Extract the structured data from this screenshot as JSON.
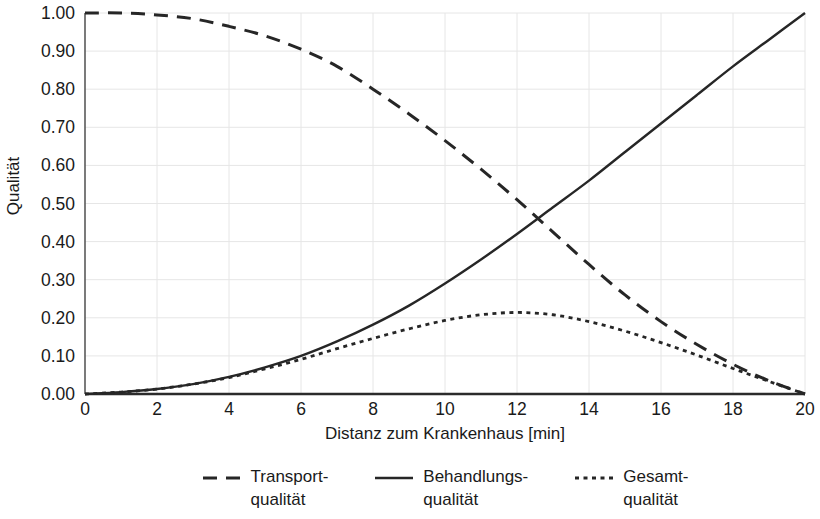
{
  "chart_data": {
    "type": "line",
    "title": "",
    "xlabel": "Distanz zum Krankenhaus [min]",
    "ylabel": "Qualität",
    "xlim": [
      0,
      20
    ],
    "ylim": [
      0,
      1.0
    ],
    "grid": true,
    "legend_position": "bottom",
    "x_ticks": [
      "0",
      "2",
      "4",
      "6",
      "8",
      "10",
      "12",
      "14",
      "16",
      "18",
      "20"
    ],
    "y_ticks": [
      "0.00",
      "0.10",
      "0.20",
      "0.30",
      "0.40",
      "0.50",
      "0.60",
      "0.70",
      "0.80",
      "0.90",
      "1.00"
    ],
    "x": [
      0,
      1,
      2,
      3,
      4,
      5,
      6,
      7,
      8,
      9,
      10,
      11,
      12,
      13,
      14,
      15,
      16,
      17,
      18,
      19,
      20
    ],
    "series": [
      {
        "name": "Transport-\nqualität",
        "legend_label": "Transport-\nqualität",
        "style": "dashed",
        "color": "#262626",
        "values": [
          1.0,
          1.0,
          0.995,
          0.985,
          0.965,
          0.94,
          0.905,
          0.86,
          0.8,
          0.735,
          0.665,
          0.59,
          0.51,
          0.425,
          0.34,
          0.26,
          0.19,
          0.13,
          0.078,
          0.035,
          0.0
        ]
      },
      {
        "name": "Behandlungs-\nqualität",
        "legend_label": "Behandlungs-\nqualität",
        "style": "solid",
        "color": "#262626",
        "values": [
          0.0,
          0.005,
          0.013,
          0.026,
          0.045,
          0.07,
          0.1,
          0.138,
          0.182,
          0.232,
          0.29,
          0.353,
          0.42,
          0.49,
          0.56,
          0.635,
          0.71,
          0.785,
          0.86,
          0.93,
          1.0
        ]
      },
      {
        "name": "Gesamt-\nqualität",
        "legend_label": "Gesamt-\nqualität",
        "style": "dotted",
        "color": "#262626",
        "values": [
          0.0,
          0.005,
          0.013,
          0.026,
          0.043,
          0.066,
          0.091,
          0.119,
          0.146,
          0.171,
          0.193,
          0.208,
          0.214,
          0.208,
          0.19,
          0.165,
          0.135,
          0.102,
          0.067,
          0.033,
          0.0
        ]
      }
    ]
  },
  "axes": {
    "y_title": "Qualität",
    "x_title": "Distanz zum Krankenhaus [min]"
  },
  "legend": {
    "items": [
      {
        "label": "Transport-\nqualität",
        "marker": "dashed-line-icon"
      },
      {
        "label": "Behandlungs-\nqualität",
        "marker": "solid-line-icon"
      },
      {
        "label": "Gesamt-\nqualität",
        "marker": "dotted-line-icon"
      }
    ]
  }
}
